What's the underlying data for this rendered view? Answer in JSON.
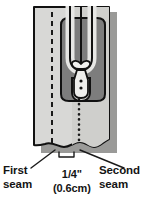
{
  "figure": {
    "colors": {
      "fabric_light": "#d8d8d6",
      "fabric_mid": "#c9c9c6",
      "zipper_tape_dark": "#7d7d7d",
      "outline": "#111111",
      "shadow": "#9a9a98",
      "teeth_channel": "#e4e4e2",
      "text": "#141414",
      "background": "#ffffff"
    }
  },
  "labels": {
    "first_seam": {
      "line1": "First",
      "line2": "seam"
    },
    "second_seam": {
      "line1": "Second",
      "line2": "seam"
    },
    "measurement": {
      "imperial": "1/4\"",
      "metric": "(0.6cm)"
    }
  },
  "parts": {
    "fabric_panel": "fabric-panel",
    "zipper_tape": "zipper-tape",
    "zipper_teeth": "zipper-teeth",
    "zipper_slider": "zipper-slider",
    "zipper_pull": "zipper-pull",
    "first_seam_stitchline": "dashed-stitch-line",
    "second_seam_stitchline": "dotted-stitch-line",
    "measurement_bracket": "measurement-bracket",
    "leader_line_left": "leader-line-first-seam",
    "leader_line_right": "leader-line-second-seam"
  }
}
